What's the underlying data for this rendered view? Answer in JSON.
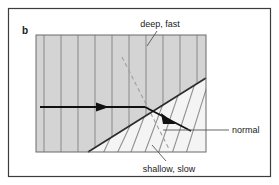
{
  "figure": {
    "panel_letter": "b",
    "background_color": "#ffffff",
    "frame_color": "#3c3c3c",
    "medium_deep_fill": "#d4d4d4",
    "medium_shallow_fill": "#f2f2f2",
    "wavefront_color": "#8a8a8a",
    "ray_color": "#111111",
    "interface_color": "#2b2b2b",
    "normal_dash_color": "#9a9a9a",
    "leader_color": "#555555"
  },
  "labels": {
    "deep_fast": "deep, fast",
    "shallow_slow": "shallow, slow",
    "normal": "normal"
  },
  "diagram": {
    "box": {
      "x": 36,
      "y": 35,
      "width": 170,
      "height": 117
    },
    "frame": {
      "x": 8,
      "y": 8,
      "width": 263,
      "height": 169
    },
    "interface": {
      "x1": 88,
      "y1": 152,
      "x2": 206,
      "y2": 78
    },
    "refraction_point": {
      "x": 145,
      "y": 107
    },
    "incident_ray": {
      "x1": 40,
      "y1": 107,
      "x2": 145,
      "y2": 107
    },
    "incident_arrowhead": {
      "x": 104,
      "y": 107
    },
    "refracted_ray": {
      "x1": 145,
      "y1": 107,
      "x2": 190,
      "y2": 131
    },
    "refracted_arrowhead": {
      "x": 172,
      "y": 122
    },
    "normal_line": {
      "x1": 122,
      "y1": 57,
      "x2": 169,
      "y2": 149
    },
    "deep_wavefront_count": 10,
    "shallow_wavefront_count": 7,
    "deep_wavefront_x": [
      44,
      61,
      78,
      95,
      112,
      129,
      146,
      163,
      180,
      197
    ],
    "leader_deep_fast": {
      "x1": 158,
      "y1": 30,
      "x2": 147,
      "y2": 45
    },
    "leader_shallow_slow": {
      "x1": 165,
      "y1": 160,
      "x2": 152,
      "y2": 145
    },
    "leader_normal": {
      "x1": 205,
      "y1": 130,
      "x2": 228,
      "y2": 130
    }
  },
  "label_positions": {
    "panel_letter": {
      "x": 22,
      "y": 31
    },
    "deep_fast": {
      "x": 160,
      "y": 26
    },
    "shallow_slow": {
      "x": 167,
      "y": 171
    },
    "normal": {
      "x": 231,
      "y": 133
    }
  }
}
